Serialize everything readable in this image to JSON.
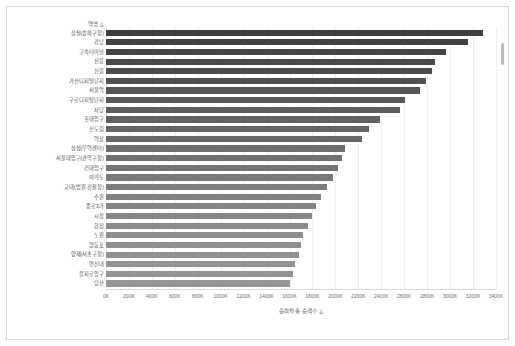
{
  "chart_data": {
    "type": "bar",
    "orientation": "horizontal",
    "title": "",
    "xlabel": "승하차 총 승객수",
    "ylabel": "역명",
    "xlim": [
      0,
      3400
    ],
    "unit": "K",
    "grid": true,
    "legend": "none",
    "xticks": [
      "0K",
      "200K",
      "400K",
      "600K",
      "800K",
      "1000K",
      "1200K",
      "1400K",
      "1600K",
      "1800K",
      "2000K",
      "2200K",
      "2400K",
      "2600K",
      "2800K",
      "3000K",
      "3200K",
      "3400K"
    ],
    "xtick_values": [
      0,
      200,
      400,
      600,
      800,
      1000,
      1200,
      1400,
      1600,
      1800,
      2000,
      2200,
      2400,
      2600,
      2800,
      3000,
      3200,
      3400
    ],
    "categories": [
      "잠실(송파구청)",
      "강남",
      "고속터미널",
      "선릉",
      "신림",
      "가산디지털단지",
      "서울역",
      "구로디지털단지",
      "사당",
      "홍대입구",
      "신도림",
      "역삼",
      "삼성(무역센터)",
      "서울대입구(관악구청)",
      "건대입구",
      "여의도",
      "교대(법원.검찰청)",
      "수원",
      "종로3가",
      "시청",
      "합정",
      "노원",
      "영등포",
      "양재(서초구청)",
      "연신내",
      "을지로입구",
      "당산"
    ],
    "values": [
      3290,
      3160,
      2960,
      2870,
      2840,
      2790,
      2740,
      2610,
      2560,
      2390,
      2290,
      2230,
      2080,
      2060,
      2020,
      1980,
      1930,
      1870,
      1830,
      1800,
      1760,
      1720,
      1700,
      1680,
      1650,
      1630,
      1600
    ],
    "bar_colors": [
      "#3f3f3f",
      "#424242",
      "#454545",
      "#494949",
      "#4d4d4d",
      "#515151",
      "#555555",
      "#595959",
      "#5d5d5d",
      "#616161",
      "#656565",
      "#696969",
      "#6d6d6d",
      "#717171",
      "#757575",
      "#797979",
      "#7d7d7d",
      "#818181",
      "#858585",
      "#888888",
      "#8b8b8b",
      "#8e8e8e",
      "#909090",
      "#929292",
      "#949494",
      "#959595",
      "#969696"
    ],
    "sort_indicator": "⇊"
  },
  "scrollbar": {
    "present": true
  }
}
